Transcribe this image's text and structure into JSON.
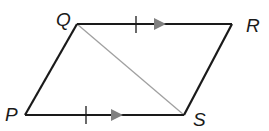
{
  "figure": {
    "type": "parallelogram",
    "vertices": {
      "Q": {
        "label": "Q",
        "x": 77,
        "y": 24
      },
      "R": {
        "label": "R",
        "x": 232,
        "y": 24
      },
      "S": {
        "label": "S",
        "x": 184,
        "y": 115
      },
      "P": {
        "label": "P",
        "x": 25,
        "y": 115
      }
    },
    "sides": [
      {
        "from": "Q",
        "to": "R",
        "tick_marks": 1,
        "parallel_arrows": 1
      },
      {
        "from": "R",
        "to": "S",
        "tick_marks": 0,
        "parallel_arrows": 0
      },
      {
        "from": "S",
        "to": "P",
        "tick_marks": 1,
        "parallel_arrows": 1
      },
      {
        "from": "P",
        "to": "Q",
        "tick_marks": 0,
        "parallel_arrows": 0
      }
    ],
    "diagonal": {
      "from": "Q",
      "to": "S"
    },
    "colors": {
      "edge": "#1a1a1a",
      "diagonal": "#a0a0a0",
      "arrow": "#808080"
    }
  }
}
